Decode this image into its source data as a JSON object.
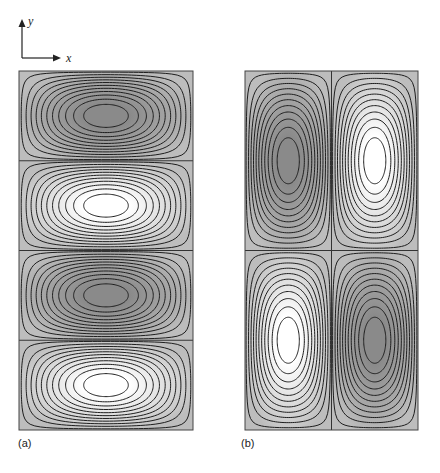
{
  "axes": {
    "y_label": "y",
    "x_label": "x"
  },
  "panels": [
    {
      "label": "(a)",
      "grid": {
        "cols": 1,
        "rows": 4
      },
      "bounds": {
        "x": 19,
        "y": 71,
        "w": 174,
        "h": 359
      },
      "cells": [
        {
          "row": 0,
          "col": 0,
          "center": "dark"
        },
        {
          "row": 1,
          "col": 0,
          "center": "light"
        },
        {
          "row": 2,
          "col": 0,
          "center": "dark"
        },
        {
          "row": 3,
          "col": 0,
          "center": "light"
        }
      ]
    },
    {
      "label": "(b)",
      "grid": {
        "cols": 2,
        "rows": 2
      },
      "bounds": {
        "x": 245,
        "y": 71,
        "w": 173,
        "h": 359
      },
      "cells": [
        {
          "row": 0,
          "col": 0,
          "center": "dark"
        },
        {
          "row": 0,
          "col": 1,
          "center": "light"
        },
        {
          "row": 1,
          "col": 0,
          "center": "light"
        },
        {
          "row": 1,
          "col": 1,
          "center": "dark"
        }
      ]
    }
  ],
  "contours_per_cell": 11,
  "colors": {
    "background": "#bdbdbd",
    "dark_center": "#8a8a8a",
    "light_center": "#ffffff",
    "line": "#1e1e1e"
  }
}
